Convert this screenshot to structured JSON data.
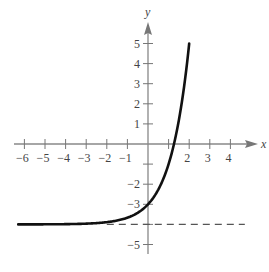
{
  "chart_data": {
    "type": "line",
    "title": "",
    "xlabel": "x",
    "ylabel": "y",
    "xlim": [
      -6.3,
      5
    ],
    "ylim": [
      -5.5,
      5.9
    ],
    "grid": false,
    "x_ticks": [
      -6,
      -5,
      -4,
      -3,
      -2,
      -1,
      1,
      2,
      3,
      4
    ],
    "x_tick_labels": [
      "−6",
      "−5",
      "−4",
      "−3",
      "−2",
      "−1",
      "",
      "2",
      "3",
      "4"
    ],
    "y_ticks": [
      5,
      4,
      3,
      2,
      1,
      -1,
      -2,
      -3,
      -4,
      -5
    ],
    "y_tick_labels": [
      "5",
      "4",
      "3",
      "2",
      "1",
      "",
      "−2",
      "−3",
      "",
      "−5"
    ],
    "series": [
      {
        "name": "f(x)",
        "function": "3^x - 4",
        "x": [
          -6,
          -5,
          -4,
          -3,
          -2,
          -1,
          0,
          0.5,
          1,
          1.26,
          1.5,
          2
        ],
        "values": [
          -3.999,
          -3.996,
          -3.988,
          -3.963,
          -3.889,
          -3.667,
          -3,
          -2.27,
          -1,
          0,
          1.2,
          5
        ],
        "color": "#111111",
        "style": "solid"
      },
      {
        "name": "asymptote",
        "function": "y = -4",
        "x": [
          -2,
          4.7
        ],
        "values": [
          -4,
          -4
        ],
        "color": "#555555",
        "style": "dashed"
      }
    ],
    "annotations": []
  }
}
